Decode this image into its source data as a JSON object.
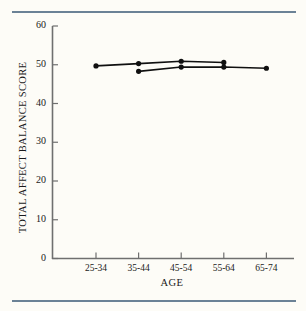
{
  "chart_data": {
    "type": "line",
    "title": "",
    "xlabel": "AGE",
    "ylabel": "TOTAL AFFECT BALANCE SCORE",
    "categories": [
      "25-34",
      "35-44",
      "45-54",
      "55-64",
      "65-74"
    ],
    "ylim": [
      0,
      60
    ],
    "yticks": [
      0,
      10,
      20,
      30,
      40,
      50,
      60
    ],
    "ytick_labels": [
      "0",
      "10",
      "20",
      "30",
      "40",
      "50",
      "60"
    ],
    "grid": false,
    "legend": false,
    "marker": "filled-circle",
    "line_color": "#101010",
    "series": [
      {
        "name": "upper",
        "x": [
          "25-34",
          "35-44",
          "45-54",
          "55-64"
        ],
        "values": [
          49.7,
          50.3,
          50.9,
          50.6
        ]
      },
      {
        "name": "lower",
        "x": [
          "35-44",
          "45-54",
          "55-64",
          "65-74"
        ],
        "values": [
          48.3,
          49.4,
          49.4,
          49.1
        ]
      }
    ]
  },
  "figure": {
    "background_color": "#fdfcf7",
    "rule_color": "#6b8296"
  }
}
